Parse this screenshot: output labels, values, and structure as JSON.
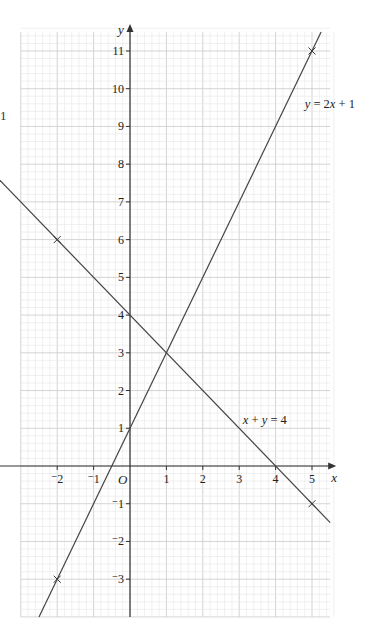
{
  "margin_fragment": "1",
  "chart_data": {
    "type": "line",
    "title": "",
    "xlabel": "x",
    "ylabel": "y",
    "origin_label": "O",
    "xlim": [
      -3,
      5.5
    ],
    "ylim": [
      -4,
      11.5
    ],
    "grid": true,
    "x_ticks": [
      -2,
      -1,
      1,
      2,
      3,
      4,
      5
    ],
    "x_tick_labels": [
      "⁻2",
      "⁻1",
      "1",
      "2",
      "3",
      "4",
      "5"
    ],
    "y_ticks": [
      -3,
      -2,
      -1,
      1,
      2,
      3,
      4,
      5,
      6,
      7,
      8,
      9,
      10,
      11
    ],
    "y_tick_labels": [
      "⁻3",
      "⁻2",
      "⁻1",
      "1",
      "2",
      "3",
      "4",
      "5",
      "6",
      "7",
      "8",
      "9",
      "10",
      "11"
    ],
    "series": [
      {
        "name": "y = 2x + 1",
        "label_parts": [
          "y",
          " = 2",
          "x",
          " + 1"
        ],
        "slope": 2,
        "intercept": 1,
        "x": [
          -2,
          5
        ],
        "y": [
          -3,
          11
        ],
        "marked_points": [
          [
            -2,
            -3
          ],
          [
            5,
            11
          ]
        ],
        "label_position": [
          4.8,
          9.5
        ]
      },
      {
        "name": "x + y = 4",
        "label_parts": [
          "x",
          " + ",
          "y",
          " = 4"
        ],
        "slope": -1,
        "intercept": 4,
        "x": [
          -2,
          5
        ],
        "y": [
          6,
          -1
        ],
        "marked_points": [
          [
            -2,
            6
          ],
          [
            5,
            -1
          ]
        ],
        "label_position": [
          3.1,
          1.1
        ]
      }
    ],
    "intersection": [
      1,
      3
    ]
  },
  "colors": {
    "grid_minor": "#e6e6e6",
    "grid_major": "#cfcfcf",
    "axis": "#333333",
    "line": "#444444"
  }
}
